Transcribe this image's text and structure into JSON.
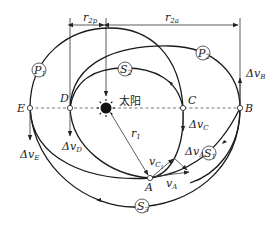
{
  "figure": {
    "sun_label": "太阳",
    "points": {
      "E": "E",
      "D": "D",
      "C": "C",
      "B": "B",
      "A": "A"
    },
    "orbit_tags": {
      "P1": {
        "main": "P",
        "sub": "1"
      },
      "P2": {
        "main": "P",
        "sub": "2"
      },
      "S1": {
        "main": "S",
        "sub": "1"
      },
      "S2": {
        "main": "S",
        "sub": "2"
      },
      "S3": {
        "main": "S",
        "sub": "3"
      }
    },
    "dimensions": {
      "r2p": {
        "main": "r",
        "sub": "2p"
      },
      "r2a": {
        "main": "r",
        "sub": "2a"
      },
      "r1": {
        "main": "r",
        "sub": "1"
      }
    },
    "velocity_labels": {
      "dvB": {
        "main": "Δv",
        "sub": "B"
      },
      "dvC": {
        "main": "Δv",
        "sub": "C"
      },
      "dvD": {
        "main": "Δv",
        "sub": "D"
      },
      "dvE": {
        "main": "Δv",
        "sub": "E"
      },
      "dvA": {
        "main": "Δv",
        "sub": "A"
      },
      "vA": {
        "main": "v",
        "sub": "A"
      },
      "vC1": {
        "main": "v",
        "sub": "C",
        "subsub": "1"
      }
    },
    "colors": {
      "line": "#1a1a1a",
      "dashed": "#666666",
      "background": "#ffffff"
    }
  }
}
